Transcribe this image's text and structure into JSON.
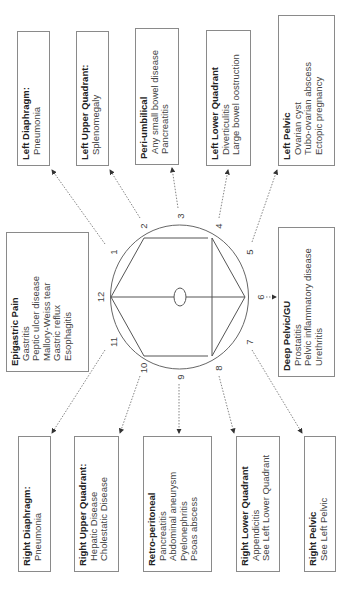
{
  "diagram": {
    "clock_numbers": [
      "1",
      "2",
      "3",
      "4",
      "5",
      "6",
      "7",
      "8",
      "9",
      "10",
      "11",
      "12"
    ],
    "boxes": [
      {
        "id": "left-diaphragm",
        "title": "Left Diaphragm:",
        "items": [
          "Pneumonia"
        ],
        "position": "1"
      },
      {
        "id": "left-upper-quadrant",
        "title": "Left Upper Quadrant:",
        "items": [
          "Splenomegaly"
        ],
        "position": "2"
      },
      {
        "id": "peri-umbilical",
        "title": "Peri-umbilical",
        "items": [
          "Any small bowel disease",
          "Pancreatitis"
        ],
        "position": "3"
      },
      {
        "id": "left-lower-quadrant",
        "title": "Left Lower Quadrant",
        "items": [
          "Diverticulitis",
          "Large bowel oostruction"
        ],
        "position": "4"
      },
      {
        "id": "left-pelvic",
        "title": "Left Pelvic",
        "items": [
          "Ovarian cyst",
          "Tubo-ovarian abscess",
          "Ectopic pregnancy"
        ],
        "position": "5"
      },
      {
        "id": "deep-pelvic-gu",
        "title": "Deep Pelvic/GU",
        "items": [
          "Prostatitis",
          "Pelvic inflammatory disease",
          "Urethritis"
        ],
        "position": "6"
      },
      {
        "id": "right-pelvic",
        "title": "Right Pelvic",
        "items": [
          "See Left Pelvic"
        ],
        "position": "7"
      },
      {
        "id": "right-lower-quadrant",
        "title": "Right Lower Quadrant",
        "items": [
          "Appendicitis",
          "See Left Lower Quadrant"
        ],
        "position": "8"
      },
      {
        "id": "retro-peritoneal",
        "title": "Retro-peritoneal",
        "items": [
          "Pancreatitis",
          "Abdominal aneurysm",
          "Pyelonephritis",
          "Psoas abscess"
        ],
        "position": "9"
      },
      {
        "id": "right-upper-quadrant",
        "title": "Right Upper Quadrant:",
        "items": [
          "Hepatic Disease",
          "Cholestatic Disease"
        ],
        "position": "10"
      },
      {
        "id": "right-diaphragm",
        "title": "Right Diaphragm:",
        "items": [
          "Pneumonia"
        ],
        "position": "11"
      },
      {
        "id": "epigastric",
        "title": "Epigastric Pain",
        "items": [
          "Gastritis",
          "Peptic ulcer disease",
          "Mallory-Weiss tear",
          "Gastric reflux",
          "Esophagitis"
        ],
        "position": "12"
      }
    ],
    "colors": {
      "line": "#666666",
      "border": "#8a8a8a",
      "text": "#333333"
    }
  }
}
